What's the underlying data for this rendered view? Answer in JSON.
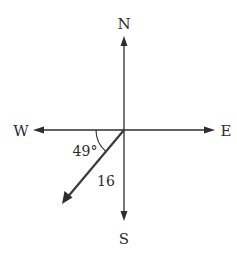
{
  "diagram": {
    "type": "compass-vector",
    "directions": {
      "north": "N",
      "south": "S",
      "east": "E",
      "west": "W"
    },
    "vector": {
      "magnitude_label": "16",
      "angle_label": "49°",
      "angle_reference": "measured from West toward South"
    },
    "colors": {
      "ink": "#2e2e2e",
      "background": "#ffffff"
    }
  }
}
